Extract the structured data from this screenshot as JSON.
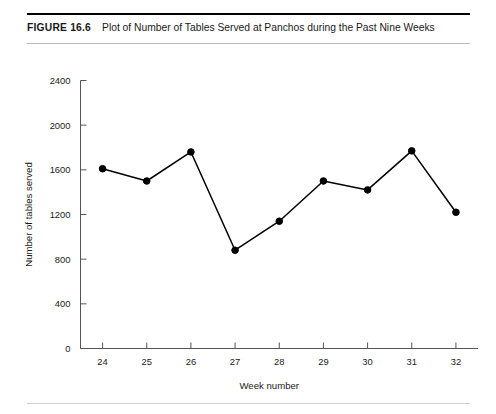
{
  "figure": {
    "number": "FIGURE 16.6",
    "title": "Plot of Number of Tables Served at Panchos during the Past Nine Weeks"
  },
  "chart_data": {
    "type": "line",
    "title": "Plot of Number of Tables Served at Panchos during the Past Nine Weeks",
    "xlabel": "Week number",
    "ylabel": "Number of tables served",
    "categories": [
      24,
      25,
      26,
      27,
      28,
      29,
      30,
      31,
      32
    ],
    "x_tick_labels": [
      "24",
      "25",
      "26",
      "27",
      "28",
      "29",
      "30",
      "31",
      "32"
    ],
    "values": [
      1610,
      1500,
      1760,
      880,
      1140,
      1500,
      1420,
      1770,
      1220
    ],
    "y_tick_labels": [
      "0",
      "400",
      "800",
      "1200",
      "1600",
      "2000",
      "2400"
    ],
    "y_ticks": [
      0,
      400,
      800,
      1200,
      1600,
      2000,
      2400
    ],
    "ylim": [
      0,
      2400
    ],
    "xlim": [
      23.5,
      32.5
    ],
    "grid": false,
    "legend": null,
    "marker": "filled-circle",
    "line_color": "#000000",
    "marker_color": "#000000",
    "background_color": "#ffffff"
  },
  "colors": {
    "rule_top": "#000000",
    "rule_bottom": "#b9b9b9",
    "axis": "#555555",
    "text": "#1a1a1a"
  }
}
